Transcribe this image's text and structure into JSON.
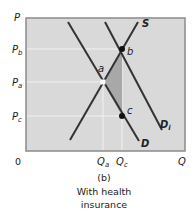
{
  "figure": {
    "panel_label": "(b)",
    "caption_line1": "With health",
    "caption_line2": "insurance"
  },
  "axes": {
    "y_label": "P",
    "x_label": "Q",
    "origin": "0",
    "y_ticks": [
      {
        "main": "P",
        "sub": "b"
      },
      {
        "main": "P",
        "sub": "a"
      },
      {
        "main": "P",
        "sub": "c"
      }
    ],
    "x_ticks": [
      {
        "main": "Q",
        "sub": "a"
      },
      {
        "main": "Q",
        "sub": "c"
      }
    ]
  },
  "curves": {
    "supply": {
      "label": "S"
    },
    "demand": {
      "label": "D"
    },
    "demand_insured": {
      "main": "D",
      "sub": "i"
    }
  },
  "points": {
    "a": {
      "label": "a",
      "style": "open"
    },
    "b": {
      "label": "b",
      "style": "filled"
    },
    "c": {
      "label": "c",
      "style": "filled"
    }
  },
  "colors": {
    "plot_bg": "#d9d9d9",
    "border": "#8a8a8a",
    "line": "#333333",
    "shade": "#a8a8a8",
    "gridline": "#f2f2f2"
  }
}
